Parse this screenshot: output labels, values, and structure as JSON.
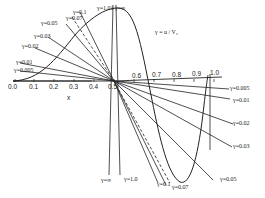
{
  "diagram": {
    "annotation": "γ = u / V₀",
    "x_axis": {
      "label": "x",
      "ticks": [
        "0.0",
        "0.1",
        "0.2",
        "0.3",
        "0.4",
        "0.5",
        "0.6",
        "0.7",
        "0.8",
        "0.9",
        "1.0"
      ]
    },
    "left_labels": [
      {
        "text": "γ=0.1",
        "x": 73,
        "y": 9
      },
      {
        "text": "γ=0.07",
        "x": 66,
        "y": 15
      },
      {
        "text": "γ=1.01",
        "x": 97,
        "y": 5
      },
      {
        "text": "γ=∞",
        "x": 115,
        "y": 5
      },
      {
        "text": "γ=0.05",
        "x": 41,
        "y": 20
      },
      {
        "text": "γ=0.03",
        "x": 34,
        "y": 33
      },
      {
        "text": "γ=0.02",
        "x": 22,
        "y": 43
      },
      {
        "text": "γ=0.01",
        "x": 16,
        "y": 59
      },
      {
        "text": "γ=0.005",
        "x": 14,
        "y": 67
      }
    ],
    "right_labels": [
      {
        "text": "γ=0.005",
        "x": 230,
        "y": 85
      },
      {
        "text": "γ=0.01",
        "x": 233,
        "y": 97
      },
      {
        "text": "γ=0.02",
        "x": 233,
        "y": 120
      },
      {
        "text": "γ=0.03",
        "x": 233,
        "y": 143
      },
      {
        "text": "γ=0.05",
        "x": 220,
        "y": 176
      },
      {
        "text": "γ=0.07",
        "x": 172,
        "y": 184
      },
      {
        "text": "γ=0.1",
        "x": 157,
        "y": 181
      },
      {
        "text": "γ=1.0",
        "x": 124,
        "y": 176
      },
      {
        "text": "γ=∞",
        "x": 101,
        "y": 177
      }
    ]
  }
}
